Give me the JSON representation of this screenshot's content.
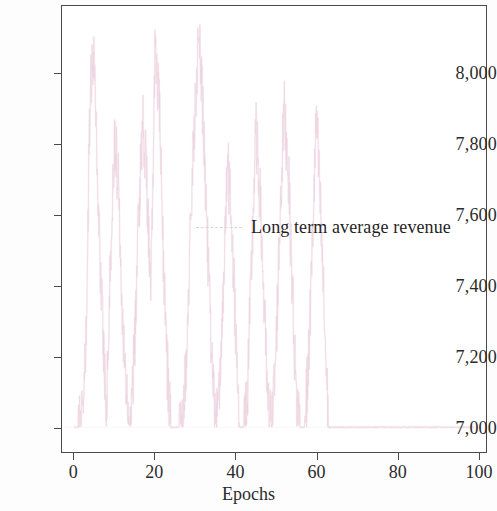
{
  "chart_data": {
    "type": "line",
    "title": "",
    "xlabel": "Epochs",
    "ylabel": "",
    "xlim": [
      -3,
      102
    ],
    "ylim": [
      6930,
      8190
    ],
    "grid": false,
    "legend_position": "inside-upper-right",
    "series": [
      {
        "name": "Long term average revenue",
        "color": "#e8c8d8",
        "x": [
          0,
          1,
          2,
          3,
          4,
          5,
          6,
          7,
          8,
          9,
          10,
          11,
          12,
          13,
          14,
          15,
          16,
          17,
          18,
          19,
          20,
          21,
          22,
          23,
          24,
          25,
          26,
          27,
          28,
          29,
          30,
          31,
          32,
          33,
          34,
          35,
          36,
          37,
          38,
          39,
          40,
          41,
          42,
          43,
          44,
          45,
          46,
          47,
          48,
          49,
          50,
          51,
          52,
          53,
          54,
          55,
          56,
          57,
          58,
          59,
          60,
          61,
          62,
          63,
          64,
          65,
          66,
          67,
          68,
          69,
          70,
          71,
          72,
          73,
          74,
          75,
          76,
          77,
          78,
          79,
          80,
          81,
          82,
          83,
          84,
          85,
          86,
          87,
          88,
          89,
          90,
          91,
          92,
          93,
          94,
          95,
          96,
          97,
          98,
          99
        ],
        "values": [
          7000,
          7000,
          7010,
          7240,
          7980,
          8070,
          7620,
          7310,
          7050,
          7460,
          7820,
          7690,
          7330,
          7080,
          7010,
          7240,
          7600,
          7880,
          7700,
          7350,
          8060,
          7940,
          7520,
          7180,
          7000,
          7000,
          7000,
          7030,
          7260,
          7610,
          7930,
          8110,
          7860,
          7540,
          7200,
          7000,
          7080,
          7420,
          7750,
          7580,
          7290,
          7000,
          7000,
          7120,
          7480,
          7840,
          7660,
          7360,
          7050,
          7000,
          7220,
          7600,
          7900,
          7740,
          7410,
          7080,
          7000,
          7000,
          7160,
          7520,
          7880,
          7620,
          7300,
          7000,
          7000,
          7000,
          7000,
          7000,
          7000,
          7000,
          7000,
          7000,
          7000,
          7000,
          7000,
          7000,
          7000,
          7000,
          7000,
          7000,
          7000,
          7000,
          7000,
          7000,
          7000,
          7000,
          7000,
          7000,
          7000,
          7000,
          7000,
          7000,
          7000,
          7000,
          7000,
          7000,
          7000,
          7000,
          7000,
          7000
        ],
        "baseline": 7000,
        "peak": 8110
      }
    ],
    "yticks": [
      {
        "value": 7000,
        "label": "7,000"
      },
      {
        "value": 7200,
        "label": "7,200"
      },
      {
        "value": 7400,
        "label": "7,400"
      },
      {
        "value": 7600,
        "label": "7,600"
      },
      {
        "value": 7800,
        "label": "7,800"
      },
      {
        "value": 8000,
        "label": "8,000"
      }
    ],
    "xticks": [
      {
        "value": 0,
        "label": "0"
      },
      {
        "value": 20,
        "label": "20"
      },
      {
        "value": 40,
        "label": "40"
      },
      {
        "value": 60,
        "label": "60"
      },
      {
        "value": 80,
        "label": "80"
      },
      {
        "value": 100,
        "label": "100"
      }
    ],
    "legend": [
      {
        "label": "Long term average revenue",
        "color": "#e8c8d8",
        "style": "dashed"
      }
    ]
  },
  "axes": {
    "x_title": "Epochs"
  },
  "legend": {
    "entry_label": "Long term average revenue"
  },
  "colors": {
    "axis": "#4a4a4a",
    "text": "#2b2b2b",
    "series": "#e8c8d8",
    "background": "#ffffff"
  }
}
